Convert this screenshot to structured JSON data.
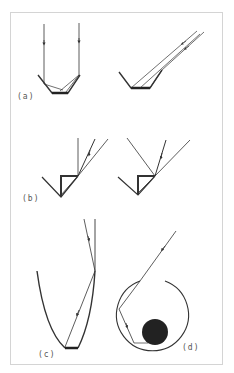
{
  "figure": {
    "panels": [
      {
        "id": "a",
        "label": "(a)",
        "description": "Trough reflectors with normal-incidence and oblique-incidence rays"
      },
      {
        "id": "b",
        "label": "(b)",
        "description": "V-groove reflectors with retro-reflected rays"
      },
      {
        "id": "c",
        "label": "(c)",
        "description": "Parabolic-style concentrator with ray reflecting to absorber"
      },
      {
        "id": "d",
        "label": "(d)",
        "description": "Circular cavity with circular absorber and multiply reflected ray"
      }
    ],
    "colors": {
      "line": "#333333",
      "absorber": "#222222",
      "frame": "#d4d4d4",
      "label": "#555555"
    }
  }
}
